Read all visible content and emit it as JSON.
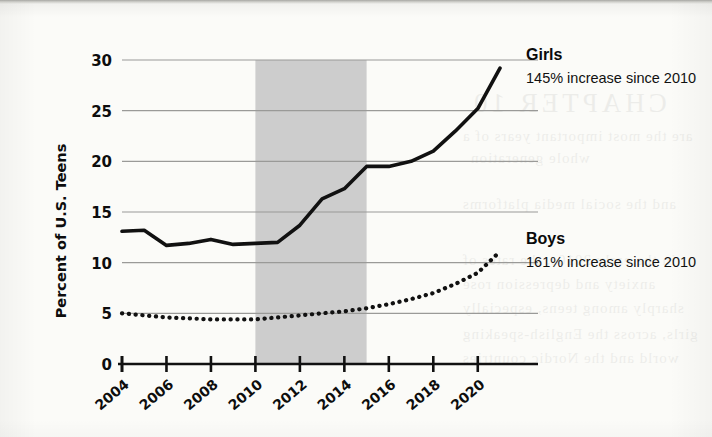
{
  "figure": {
    "yaxis_title": "Percent of U.S. Teens",
    "y_ticks": [
      "0",
      "5",
      "10",
      "15",
      "20",
      "25",
      "30"
    ],
    "x_ticks": [
      "2004",
      "2006",
      "2008",
      "2010",
      "2012",
      "2014",
      "2016",
      "2018",
      "2020"
    ],
    "colors": {
      "line": "#111111",
      "gridline": "#9a9a98",
      "axis": "#111111",
      "shaded_band": "#c9c9c9",
      "page": "#fbfbf8"
    },
    "annotations": {
      "girls_title": "Girls",
      "girls_subtitle": "145% increase since 2010",
      "boys_title": "Boys",
      "boys_subtitle": "161% increase since 2010"
    }
  },
  "bleed_through": {
    "heading": "CHAPTER 10",
    "line1": "are the most important years of a",
    "line2": "whole generation",
    "line3": "and the social media platforms",
    "line4": "in the early 2010s, the rates of",
    "line5": "anxiety and depression rose",
    "line6": "sharply among teens, especially",
    "line7": "girls, across the English-speaking",
    "line8": "world and the Nordic countries"
  },
  "chart_data": {
    "type": "line",
    "title": "",
    "subtitle": "",
    "xlabel": "",
    "ylabel": "Percent of U.S. Teens",
    "xlim": [
      2004,
      2021
    ],
    "ylim": [
      0,
      30
    ],
    "yticks": [
      0,
      5,
      10,
      15,
      20,
      25,
      30
    ],
    "xticks": [
      2004,
      2006,
      2008,
      2010,
      2012,
      2014,
      2016,
      2018,
      2020
    ],
    "grid": "horizontal",
    "legend_position": "right-inline-labels",
    "shaded_region": {
      "label": "",
      "x_start": 2010,
      "x_end": 2015,
      "color": "#c9c9c9"
    },
    "x": [
      2004,
      2005,
      2006,
      2007,
      2008,
      2009,
      2010,
      2011,
      2012,
      2013,
      2014,
      2015,
      2016,
      2017,
      2018,
      2019,
      2020,
      2021
    ],
    "series": [
      {
        "name": "Girls",
        "style": "solid",
        "color": "#111111",
        "annotation": "145% increase since 2010",
        "values": [
          13.1,
          13.2,
          11.7,
          11.9,
          12.3,
          11.8,
          11.9,
          12.0,
          13.7,
          16.3,
          17.3,
          19.5,
          19.5,
          20.0,
          21.0,
          23.0,
          25.2,
          29.2
        ]
      },
      {
        "name": "Boys",
        "style": "dotted",
        "color": "#111111",
        "annotation": "161% increase since 2010",
        "values": [
          5.0,
          4.8,
          4.6,
          4.5,
          4.4,
          4.4,
          4.4,
          4.6,
          4.8,
          5.0,
          5.2,
          5.5,
          5.9,
          6.4,
          7.0,
          7.9,
          9.0,
          11.1
        ]
      }
    ]
  }
}
